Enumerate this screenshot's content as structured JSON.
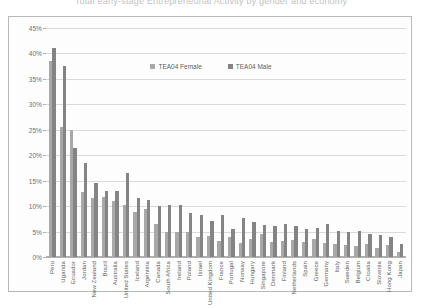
{
  "chart_data": {
    "type": "bar",
    "title": "Total early-stage Entrepreneurial Activity by gender and economy",
    "xlabel": "",
    "ylabel": "",
    "ylim": [
      0,
      45
    ],
    "ytick_labels": [
      "0%",
      "5%",
      "10%",
      "15%",
      "20%",
      "25%",
      "30%",
      "35%",
      "40%",
      "45%"
    ],
    "ytick_values": [
      0,
      5,
      10,
      15,
      20,
      25,
      30,
      35,
      40,
      45
    ],
    "grid": true,
    "legend_position": "top-center",
    "categories": [
      "Peru",
      "Uganda",
      "Ecuador",
      "Jordan",
      "New Zealand",
      "Brazil",
      "Australia",
      "United States",
      "Iceland",
      "Argentina",
      "Canada",
      "South Africa",
      "Ireland",
      "Poland",
      "Israel",
      "United Kingdom",
      "France",
      "Portugal",
      "Norway",
      "Hungary",
      "Singapore",
      "Denmark",
      "Finland",
      "Netherlands",
      "Spain",
      "Greece",
      "Germany",
      "Italy",
      "Sweden",
      "Belgium",
      "Croatia",
      "Slovenia",
      "Hong Kong",
      "Japan"
    ],
    "series": [
      {
        "name": "TEA04 Female",
        "color": "#a8a8a8",
        "values": [
          38.5,
          25.5,
          25.0,
          12.8,
          11.5,
          11.8,
          11.0,
          10.2,
          8.8,
          9.5,
          6.5,
          5.0,
          5.0,
          5.0,
          4.0,
          4.2,
          3.2,
          4.0,
          2.8,
          3.6,
          4.5,
          3.0,
          3.2,
          3.4,
          3.0,
          3.6,
          2.8,
          2.6,
          2.4,
          2.2,
          2.6,
          1.8,
          2.4,
          0.9
        ]
      },
      {
        "name": "TEA04 Male",
        "color": "#848484",
        "values": [
          41.0,
          37.5,
          21.5,
          18.5,
          14.5,
          13.0,
          13.0,
          16.5,
          11.5,
          11.2,
          10.0,
          10.2,
          10.2,
          8.6,
          8.2,
          7.0,
          8.2,
          5.5,
          7.6,
          6.8,
          6.2,
          6.0,
          6.4,
          6.0,
          5.5,
          5.8,
          6.4,
          5.2,
          5.0,
          5.2,
          4.6,
          4.4,
          4.0,
          2.5
        ]
      }
    ]
  },
  "legend": [
    {
      "label": "TEA04 Female"
    },
    {
      "label": "TEA04 Male"
    }
  ]
}
